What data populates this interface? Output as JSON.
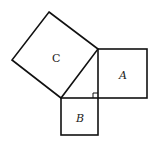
{
  "diagram": {
    "type": "pythagorean-theorem",
    "line_color": "#111111",
    "background": "#ffffff",
    "squares": [
      {
        "id": "C",
        "label": "C",
        "description": "square on hypotenuse"
      },
      {
        "id": "A",
        "label": "A",
        "description": "square on vertical leg"
      },
      {
        "id": "B",
        "label": "B",
        "description": "square on horizontal leg"
      }
    ],
    "right_angle_marker": true
  }
}
